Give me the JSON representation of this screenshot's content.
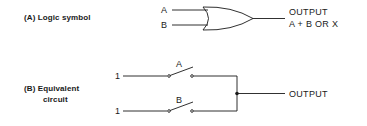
{
  "section_a": {
    "label": "(A)  Logic symbol",
    "gate_type": "OR gate",
    "inputs": [
      "A",
      "B"
    ],
    "output_label": "OUTPUT",
    "expression": "A + B  OR X"
  },
  "section_b": {
    "label_line1": "(B)  Equivalent",
    "label_line2": "circuit",
    "branches": [
      {
        "source": "1",
        "switch": "A"
      },
      {
        "source": "1",
        "switch": "B"
      }
    ],
    "output_label": "OUTPUT"
  },
  "colors": {
    "ink": "#1a1a1a",
    "background": "#ffffff"
  }
}
